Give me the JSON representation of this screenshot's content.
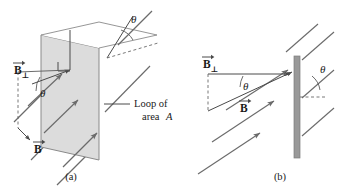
{
  "figure": {
    "background_color": "#ffffff",
    "plane_fill_color": "#dcdcdc",
    "plane_stroke_color": "#8a8a8a",
    "bar_fill_color": "#999999",
    "line_color": "#6b6b6b",
    "text_color": "#1a1a1a"
  },
  "panel_a": {
    "caption": "(a)",
    "labels": {
      "b_perp_symbol": "B",
      "b_perp_subscript": "⊥",
      "b_symbol": "B",
      "theta_top": "θ",
      "theta_left": "θ",
      "annotation_line1": "Loop of",
      "annotation_line2_prefix": "area ",
      "annotation_line2_italic": "A"
    },
    "field_line_count": 4,
    "description": "Perspective view: a tilted rectangular loop of area A with a normal vector, pierced by parallel magnetic field lines at angle theta to the normal."
  },
  "panel_b": {
    "caption": "(b)",
    "labels": {
      "b_perp_symbol": "B",
      "b_perp_subscript": "⊥",
      "b_symbol": "B",
      "theta_left": "θ",
      "theta_right": "θ"
    },
    "field_line_count": 4,
    "description": "Edge-on view: the loop seen as a vertical gray bar, with B resolved into the perpendicular component B-perp at angle theta."
  }
}
